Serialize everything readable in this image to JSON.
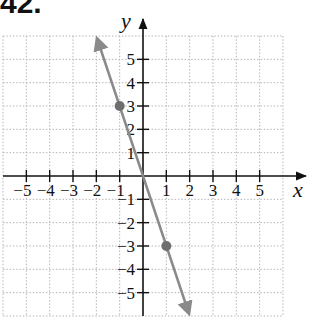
{
  "problem": {
    "number": "42."
  },
  "chart_data": {
    "type": "line",
    "title": "",
    "xlabel": "x",
    "ylabel": "y",
    "xlim": [
      -6,
      6
    ],
    "ylim": [
      -6,
      6
    ],
    "grid": true,
    "x_ticks": [
      "-5",
      "-4",
      "-3",
      "-2",
      "-1",
      "1",
      "2",
      "3",
      "4",
      "5"
    ],
    "y_ticks": [
      "5",
      "4",
      "3",
      "2",
      "1",
      "-1",
      "-2",
      "-3",
      "-4",
      "-5"
    ],
    "series": [
      {
        "name": "y = -3x",
        "equation": "y = -3x",
        "slope": -3,
        "intercept": 0,
        "line_extent": {
          "from": [
            -1.97,
            5.9
          ],
          "to": [
            1.97,
            -5.9
          ]
        },
        "arrows": "both",
        "color": "#8a8a8a",
        "points": [
          {
            "x": -1,
            "y": 3
          },
          {
            "x": 1,
            "y": -3
          }
        ]
      }
    ],
    "legend": null
  },
  "colors": {
    "axis": "#111111",
    "grid": "#b5b5b5",
    "line": "#8a8a8a",
    "point": "#6e6e6e"
  }
}
